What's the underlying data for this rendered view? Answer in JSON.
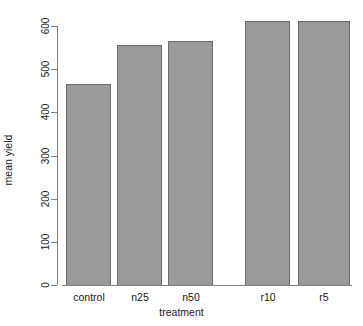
{
  "chart_data": {
    "type": "bar",
    "title": "",
    "subtitle": "",
    "xlabel": "treatment",
    "ylabel": "mean yield",
    "categories": [
      "control",
      "n25",
      "n50",
      "r10",
      "r5"
    ],
    "values": [
      465,
      556,
      565,
      612,
      612
    ],
    "series": [
      {
        "name": "mean yield",
        "values": [
          465,
          556,
          565,
          612,
          612
        ]
      }
    ],
    "ylim": [
      0,
      620
    ],
    "y_ticks": [
      0,
      100,
      200,
      300,
      400,
      500,
      600
    ],
    "y_tick_labels": [
      "0",
      "100",
      "200",
      "300",
      "400",
      "500",
      "600"
    ],
    "x_tick_labels": [
      "control",
      "n25",
      "n50",
      "r10",
      "r5"
    ],
    "grid": false,
    "legend": false,
    "legend_position": "none",
    "bar_fill_color": "#9a9a9a",
    "bar_border_color": "#6b6b6b",
    "axis_color": "#808080",
    "text_color": "#1a1a1a",
    "background_color": "#ffffff",
    "y_tick_label_rotation": -90,
    "style": "r-base-graphics"
  }
}
